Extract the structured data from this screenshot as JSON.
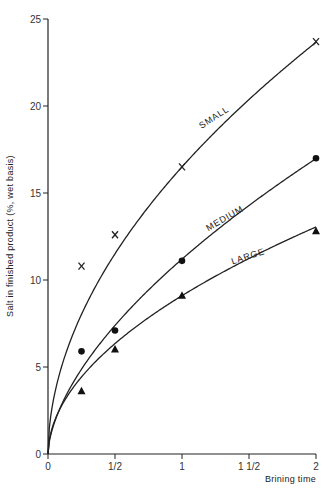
{
  "chart_data": {
    "type": "scatter",
    "title": "",
    "xlabel": "Brining time",
    "ylabel": "Salt in finished product (%, wet basis)",
    "xlim": [
      0,
      2
    ],
    "ylim": [
      0,
      25
    ],
    "grid": false,
    "legend": "none (curves labeled inline)",
    "x_ticks": [
      0,
      0.5,
      1,
      1.5,
      2
    ],
    "x_tick_labels": [
      "0",
      "1/2",
      "1",
      "1 1/2",
      "2"
    ],
    "y_ticks": [
      0,
      5,
      10,
      15,
      20,
      25
    ],
    "y_tick_labels": [
      "0",
      "5",
      "10",
      "15",
      "20",
      "25"
    ],
    "series": [
      {
        "name": "SMALL",
        "marker": "x",
        "x": [
          0.25,
          0.5,
          1,
          2
        ],
        "values": [
          10.8,
          12.6,
          16.5,
          23.7
        ],
        "curve": {
          "a": 16.5,
          "b": 0.52
        },
        "label_pos": {
          "x": 1.25,
          "y": 19.2,
          "angle": -33
        }
      },
      {
        "name": "MEDIUM",
        "marker": "circle",
        "x": [
          0.25,
          0.5,
          1,
          2
        ],
        "values": [
          5.9,
          7.1,
          11.1,
          17.0
        ],
        "curve": {
          "a": 11.2,
          "b": 0.6
        },
        "label_pos": {
          "x": 1.33,
          "y": 13.4,
          "angle": -30
        }
      },
      {
        "name": "LARGE",
        "marker": "triangle",
        "x": [
          0.25,
          0.5,
          1,
          2
        ],
        "values": [
          3.6,
          6.0,
          9.1,
          12.8
        ],
        "curve": {
          "a": 9.1,
          "b": 0.52
        },
        "label_pos": {
          "x": 1.5,
          "y": 11.2,
          "angle": -18
        }
      }
    ]
  }
}
